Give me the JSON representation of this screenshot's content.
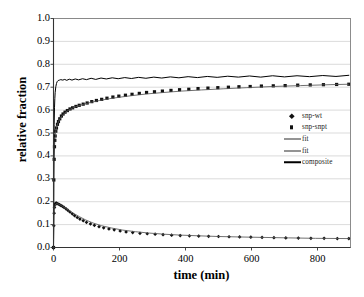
{
  "chart_data": {
    "type": "scatter",
    "title": "",
    "xlabel": "time (min)",
    "ylabel": "relative fraction",
    "xlim": [
      0,
      900
    ],
    "ylim": [
      0,
      1.0
    ],
    "xticks": [
      0,
      200,
      400,
      600,
      800
    ],
    "ytick_labels": [
      "0.0",
      "0.1",
      "0.2",
      "0.3",
      "0.4",
      "0.5",
      "0.6",
      "0.7",
      "0.8",
      "0.9",
      "1.0"
    ],
    "yticks": [
      0.0,
      0.1,
      0.2,
      0.3,
      0.4,
      0.5,
      0.6,
      0.7,
      0.8,
      0.9,
      1.0
    ],
    "grid": "horizontal",
    "legend_position": "center-right",
    "series": [
      {
        "name": "snp-wt",
        "style": "markers",
        "marker": "diamond",
        "color": "#111111",
        "points": [
          [
            0,
            0.0
          ],
          [
            1,
            0.095
          ],
          [
            2,
            0.15
          ],
          [
            3,
            0.175
          ],
          [
            4,
            0.186
          ],
          [
            6,
            0.192
          ],
          [
            8,
            0.194
          ],
          [
            10,
            0.193
          ],
          [
            14,
            0.19
          ],
          [
            18,
            0.187
          ],
          [
            22,
            0.184
          ],
          [
            27,
            0.18
          ],
          [
            32,
            0.175
          ],
          [
            38,
            0.169
          ],
          [
            44,
            0.162
          ],
          [
            50,
            0.155
          ],
          [
            57,
            0.147
          ],
          [
            64,
            0.139
          ],
          [
            72,
            0.131
          ],
          [
            80,
            0.124
          ],
          [
            90,
            0.117
          ],
          [
            100,
            0.11
          ],
          [
            112,
            0.103
          ],
          [
            124,
            0.097
          ],
          [
            138,
            0.091
          ],
          [
            152,
            0.086
          ],
          [
            168,
            0.081
          ],
          [
            184,
            0.077
          ],
          [
            202,
            0.072
          ],
          [
            220,
            0.068
          ],
          [
            240,
            0.065
          ],
          [
            262,
            0.062
          ],
          [
            284,
            0.06
          ],
          [
            308,
            0.058
          ],
          [
            332,
            0.056
          ],
          [
            358,
            0.054
          ],
          [
            384,
            0.052
          ],
          [
            412,
            0.051
          ],
          [
            440,
            0.05
          ],
          [
            470,
            0.049
          ],
          [
            500,
            0.048
          ],
          [
            532,
            0.047
          ],
          [
            564,
            0.046
          ],
          [
            598,
            0.045
          ],
          [
            632,
            0.044
          ],
          [
            668,
            0.043
          ],
          [
            704,
            0.042
          ],
          [
            742,
            0.041
          ],
          [
            780,
            0.04
          ],
          [
            820,
            0.04
          ],
          [
            860,
            0.039
          ],
          [
            895,
            0.039
          ]
        ]
      },
      {
        "name": "snp-snpt",
        "style": "markers",
        "marker": "square",
        "color": "#111111",
        "points": [
          [
            0,
            0.0
          ],
          [
            1,
            0.295
          ],
          [
            2,
            0.385
          ],
          [
            3,
            0.44
          ],
          [
            4,
            0.468
          ],
          [
            5,
            0.487
          ],
          [
            7,
            0.508
          ],
          [
            9,
            0.522
          ],
          [
            12,
            0.538
          ],
          [
            15,
            0.55
          ],
          [
            19,
            0.562
          ],
          [
            24,
            0.574
          ],
          [
            29,
            0.583
          ],
          [
            35,
            0.591
          ],
          [
            42,
            0.598
          ],
          [
            50,
            0.605
          ],
          [
            58,
            0.61
          ],
          [
            68,
            0.616
          ],
          [
            78,
            0.621
          ],
          [
            90,
            0.626
          ],
          [
            102,
            0.631
          ],
          [
            116,
            0.637
          ],
          [
            130,
            0.642
          ],
          [
            146,
            0.647
          ],
          [
            162,
            0.652
          ],
          [
            180,
            0.657
          ],
          [
            198,
            0.661
          ],
          [
            218,
            0.665
          ],
          [
            238,
            0.669
          ],
          [
            260,
            0.673
          ],
          [
            282,
            0.677
          ],
          [
            306,
            0.68
          ],
          [
            330,
            0.683
          ],
          [
            356,
            0.686
          ],
          [
            382,
            0.689
          ],
          [
            410,
            0.691
          ],
          [
            438,
            0.694
          ],
          [
            468,
            0.696
          ],
          [
            498,
            0.698
          ],
          [
            530,
            0.7
          ],
          [
            562,
            0.702
          ],
          [
            596,
            0.703
          ],
          [
            630,
            0.705
          ],
          [
            666,
            0.706
          ],
          [
            702,
            0.707
          ],
          [
            740,
            0.709
          ],
          [
            778,
            0.71
          ],
          [
            818,
            0.711
          ],
          [
            858,
            0.712
          ],
          [
            895,
            0.713
          ]
        ]
      },
      {
        "name": "fit",
        "style": "line",
        "color": "#555555",
        "points": [
          [
            0,
            0.0
          ],
          [
            2,
            0.148
          ],
          [
            4,
            0.178
          ],
          [
            7,
            0.19
          ],
          [
            10,
            0.192
          ],
          [
            16,
            0.189
          ],
          [
            24,
            0.183
          ],
          [
            34,
            0.174
          ],
          [
            46,
            0.163
          ],
          [
            60,
            0.15
          ],
          [
            78,
            0.135
          ],
          [
            98,
            0.12
          ],
          [
            120,
            0.107
          ],
          [
            146,
            0.095
          ],
          [
            176,
            0.085
          ],
          [
            210,
            0.076
          ],
          [
            248,
            0.069
          ],
          [
            290,
            0.063
          ],
          [
            336,
            0.058
          ],
          [
            386,
            0.054
          ],
          [
            440,
            0.051
          ],
          [
            500,
            0.048
          ],
          [
            566,
            0.046
          ],
          [
            636,
            0.044
          ],
          [
            712,
            0.042
          ],
          [
            794,
            0.04
          ],
          [
            895,
            0.039
          ]
        ]
      },
      {
        "name": "fit",
        "style": "line",
        "color": "#555555",
        "points": [
          [
            0,
            0.0
          ],
          [
            1,
            0.3
          ],
          [
            2,
            0.39
          ],
          [
            4,
            0.47
          ],
          [
            6,
            0.5
          ],
          [
            9,
            0.523
          ],
          [
            13,
            0.542
          ],
          [
            18,
            0.558
          ],
          [
            25,
            0.574
          ],
          [
            34,
            0.588
          ],
          [
            45,
            0.599
          ],
          [
            58,
            0.609
          ],
          [
            74,
            0.618
          ],
          [
            92,
            0.626
          ],
          [
            114,
            0.634
          ],
          [
            140,
            0.642
          ],
          [
            170,
            0.65
          ],
          [
            204,
            0.657
          ],
          [
            242,
            0.664
          ],
          [
            286,
            0.671
          ],
          [
            334,
            0.677
          ],
          [
            388,
            0.683
          ],
          [
            448,
            0.688
          ],
          [
            514,
            0.693
          ],
          [
            586,
            0.698
          ],
          [
            664,
            0.703
          ],
          [
            748,
            0.707
          ],
          [
            838,
            0.711
          ],
          [
            895,
            0.713
          ]
        ]
      },
      {
        "name": "composite",
        "style": "line",
        "color": "#000000",
        "note": "sum of the two components; plateaus near 0.745 with small oscillation",
        "points": [
          [
            0,
            0.0
          ],
          [
            1,
            0.395
          ],
          [
            2,
            0.538
          ],
          [
            3,
            0.61
          ],
          [
            4,
            0.65
          ],
          [
            5,
            0.676
          ],
          [
            7,
            0.702
          ],
          [
            9,
            0.716
          ],
          [
            11,
            0.724
          ],
          [
            14,
            0.729
          ],
          [
            18,
            0.731
          ],
          [
            22,
            0.733
          ],
          [
            28,
            0.731
          ],
          [
            34,
            0.734
          ],
          [
            40,
            0.73
          ],
          [
            48,
            0.735
          ],
          [
            56,
            0.731
          ],
          [
            66,
            0.736
          ],
          [
            76,
            0.732
          ],
          [
            88,
            0.737
          ],
          [
            100,
            0.733
          ],
          [
            114,
            0.739
          ],
          [
            128,
            0.734
          ],
          [
            144,
            0.74
          ],
          [
            160,
            0.736
          ],
          [
            178,
            0.741
          ],
          [
            196,
            0.737
          ],
          [
            216,
            0.742
          ],
          [
            236,
            0.738
          ],
          [
            258,
            0.743
          ],
          [
            280,
            0.739
          ],
          [
            304,
            0.744
          ],
          [
            328,
            0.74
          ],
          [
            354,
            0.745
          ],
          [
            380,
            0.741
          ],
          [
            408,
            0.746
          ],
          [
            436,
            0.742
          ],
          [
            466,
            0.747
          ],
          [
            496,
            0.743
          ],
          [
            528,
            0.748
          ],
          [
            560,
            0.744
          ],
          [
            594,
            0.749
          ],
          [
            628,
            0.744
          ],
          [
            664,
            0.75
          ],
          [
            700,
            0.745
          ],
          [
            738,
            0.75
          ],
          [
            776,
            0.746
          ],
          [
            816,
            0.751
          ],
          [
            856,
            0.747
          ],
          [
            895,
            0.752
          ]
        ]
      }
    ],
    "legend": [
      {
        "label": "snp-wt",
        "style": "marker",
        "marker": "diamond"
      },
      {
        "label": "snp-snpt",
        "style": "marker",
        "marker": "square"
      },
      {
        "label": "fit",
        "style": "line",
        "marker": "thin"
      },
      {
        "label": "fit",
        "style": "line",
        "marker": "thin"
      },
      {
        "label": "composite",
        "style": "line",
        "marker": "thick"
      }
    ]
  }
}
